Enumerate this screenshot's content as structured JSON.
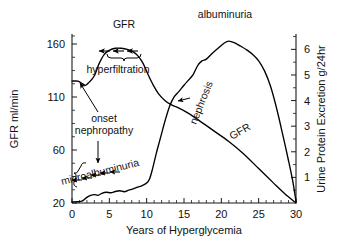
{
  "chart_data": {
    "type": "line",
    "title": "",
    "xlabel": "Years of Hyperglycemia",
    "ylabel": "GFR ml/min",
    "y2label": "Urine Protein Excretion g/24hr",
    "xlim": [
      0,
      30
    ],
    "xticks": [
      "0",
      "5",
      "10",
      "15",
      "20",
      "25",
      "30"
    ],
    "xtick_values": [
      0,
      5,
      10,
      15,
      20,
      25,
      30
    ],
    "x_minor_tick_step": 1,
    "yticks": [
      "20",
      "60",
      "110",
      "160"
    ],
    "ytick_values": [
      20,
      60,
      110,
      160
    ],
    "ylim": [
      20,
      168
    ],
    "y2ticks": [
      "1",
      "2",
      "3",
      "4",
      "5",
      "6"
    ],
    "y2tick_values": [
      1,
      2,
      3,
      4,
      5,
      6
    ],
    "y2lim": [
      0,
      6.6
    ],
    "grid": false,
    "legend": "none",
    "series": [
      {
        "name": "GFR",
        "axis": "left",
        "units": "ml/min",
        "points": [
          [
            0,
            125
          ],
          [
            0.8,
            125
          ],
          [
            1.3,
            123
          ],
          [
            1.8,
            121
          ],
          [
            2.3,
            124
          ],
          [
            3.0,
            130
          ],
          [
            3.6,
            141
          ],
          [
            4.3,
            150
          ],
          [
            5.0,
            154
          ],
          [
            5.8,
            156
          ],
          [
            6.6,
            156
          ],
          [
            7.4,
            155
          ],
          [
            8.1,
            153
          ],
          [
            8.8,
            149
          ],
          [
            9.5,
            142
          ],
          [
            10.2,
            131
          ],
          [
            10.9,
            121
          ],
          [
            11.6,
            113
          ],
          [
            12.4,
            107
          ],
          [
            13.2,
            103
          ],
          [
            14.2,
            100
          ],
          [
            15.5,
            95
          ],
          [
            17.0,
            88
          ],
          [
            19.0,
            78
          ],
          [
            21.0,
            68
          ],
          [
            23.0,
            57
          ],
          [
            25.0,
            46
          ],
          [
            27.0,
            35
          ],
          [
            28.5,
            27
          ],
          [
            30,
            20
          ]
        ]
      },
      {
        "name": "albuminuria",
        "axis": "right",
        "units": "g/24hr",
        "points": [
          [
            0,
            0.04
          ],
          [
            0.8,
            0.05
          ],
          [
            1.4,
            0.08
          ],
          [
            2.0,
            0.22
          ],
          [
            2.5,
            0.3
          ],
          [
            3.0,
            0.33
          ],
          [
            3.5,
            0.3
          ],
          [
            4.0,
            0.38
          ],
          [
            4.6,
            0.42
          ],
          [
            5.2,
            0.4
          ],
          [
            5.8,
            0.45
          ],
          [
            6.4,
            0.48
          ],
          [
            7.0,
            0.44
          ],
          [
            7.6,
            0.5
          ],
          [
            8.2,
            0.55
          ],
          [
            8.8,
            0.62
          ],
          [
            9.4,
            0.68
          ],
          [
            10.0,
            0.78
          ],
          [
            10.4,
            0.95
          ],
          [
            10.8,
            1.35
          ],
          [
            11.3,
            1.95
          ],
          [
            11.9,
            2.6
          ],
          [
            12.5,
            3.25
          ],
          [
            13.1,
            3.8
          ],
          [
            13.7,
            4.15
          ],
          [
            14.3,
            4.35
          ],
          [
            15.0,
            4.6
          ],
          [
            15.6,
            4.8
          ],
          [
            16.2,
            5.0
          ],
          [
            16.8,
            5.35
          ],
          [
            17.4,
            5.55
          ],
          [
            18.0,
            5.62
          ],
          [
            18.8,
            5.85
          ],
          [
            19.6,
            6.05
          ],
          [
            20.4,
            6.25
          ],
          [
            21.0,
            6.32
          ],
          [
            21.8,
            6.25
          ],
          [
            22.6,
            6.12
          ],
          [
            23.4,
            5.98
          ],
          [
            24.2,
            5.8
          ],
          [
            25.0,
            5.55
          ],
          [
            25.8,
            5.15
          ],
          [
            26.6,
            4.55
          ],
          [
            27.4,
            3.7
          ],
          [
            28.2,
            2.7
          ],
          [
            29.0,
            1.65
          ],
          [
            29.6,
            0.8
          ],
          [
            30,
            0.05
          ]
        ]
      }
    ],
    "annotations": [
      {
        "id": "gfr-rise-label",
        "text": "GFR",
        "x": 5.8,
        "y_axis": "left",
        "note": "label above three up-arrows with brace under the hyperfiltration plateau"
      },
      {
        "id": "hyperfiltration-label",
        "text": "hyperfiltration",
        "x": 5.0,
        "y_axis": "left"
      },
      {
        "id": "onset-nephropathy-label",
        "text": "onset\nnephropathy",
        "line1": "onset",
        "line2": "nephropathy",
        "x": 3.5,
        "y_axis": "left",
        "note": "two arrows: one up-left to GFR curve, one down to albuminuria curve"
      },
      {
        "id": "microalbuminuria-label",
        "text": "microalbuminuria",
        "x": 4.5,
        "rotation": -14,
        "note": "slanted label above brace with five down-arrows"
      },
      {
        "id": "albuminuria-label",
        "text": "albuminuria",
        "x": 20.5,
        "y_axis": "right"
      },
      {
        "id": "nephrosis-label",
        "text": "nephrosis",
        "x": 16.5,
        "rotation": -68,
        "note": "rotated label with arrow pointing left to albuminuria curve"
      },
      {
        "id": "gfr-decline-label",
        "text": "GFR",
        "x": 22.5,
        "rotation": -30,
        "note": "rotated label along the declining GFR line"
      }
    ]
  },
  "axes": {
    "x": {
      "title": "Years of Hyperglycemia",
      "ticks": [
        "0",
        "5",
        "10",
        "15",
        "20",
        "25",
        "30"
      ]
    },
    "y_left": {
      "title": "GFR ml/min",
      "ticks": [
        "20",
        "60",
        "110",
        "160"
      ]
    },
    "y_right": {
      "title": "Urine Protein Excretion g/24hr",
      "ticks": [
        "1",
        "2",
        "3",
        "4",
        "5",
        "6"
      ]
    }
  },
  "colors": {
    "line": "#000000",
    "axis": "#1a1a1a",
    "text": "#111111",
    "background": "#ffffff"
  }
}
